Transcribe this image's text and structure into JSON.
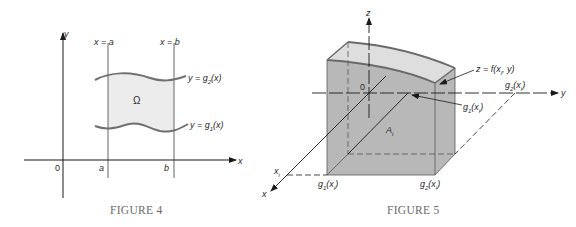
{
  "figure4": {
    "caption": "FIGURE 4",
    "axis_x_label": "x",
    "axis_y_label": "y",
    "origin_label": "0",
    "line_a_label": "x = a",
    "line_b_label": "x = b",
    "tick_a_label": "a",
    "tick_b_label": "b",
    "region_label": "Ω",
    "upper_curve_label": "y = g",
    "upper_curve_sub": "2",
    "upper_curve_arg": "(x)",
    "lower_curve_label": "y = g",
    "lower_curve_sub": "1",
    "lower_curve_arg": "(x)",
    "region_fill": "#ececec"
  },
  "figure5": {
    "caption": "FIGURE 5",
    "axis_z_label": "z",
    "axis_y_label": "y",
    "axis_x_label": "x",
    "origin_label": "0",
    "xi_label": "x",
    "xi_sub": "i",
    "surface_label": "z = f(x",
    "surface_sub": "i",
    "surface_tail": ", y)",
    "area_label": "A",
    "area_sub": "i",
    "g1_label": "g",
    "g1_sub": "1",
    "g1_arg": "(x",
    "g1_arg_sub": "i",
    "g1_close": ")",
    "g2_label": "g",
    "g2_sub": "2",
    "g2_arg": "(x",
    "g2_arg_sub": "i",
    "g2_close": ")",
    "box_fill": "#b8b8b8",
    "top_fill": "#dedede"
  }
}
